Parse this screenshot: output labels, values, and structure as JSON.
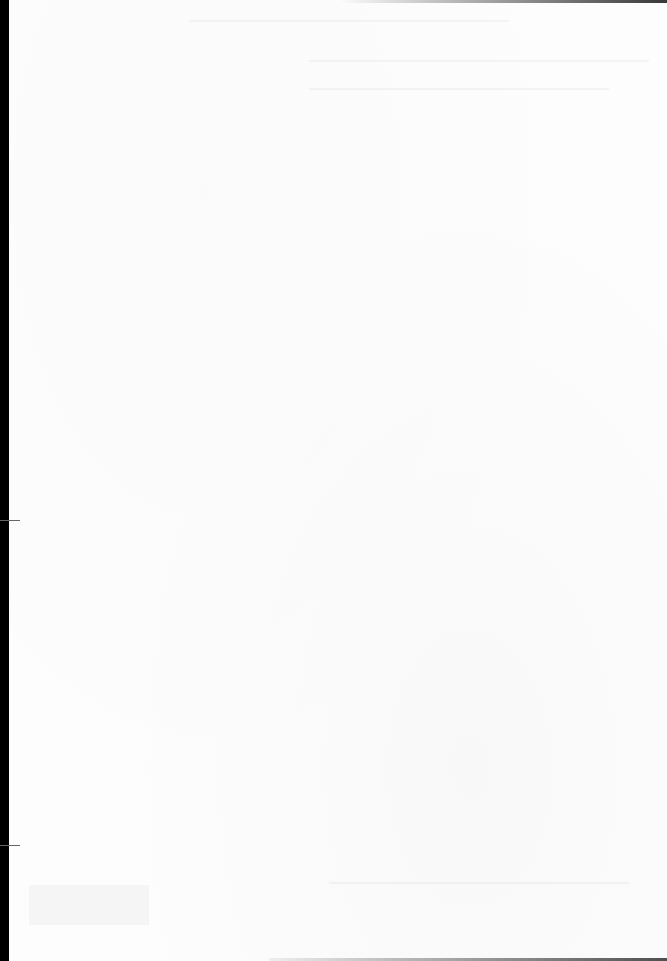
{
  "document": {
    "type": "scanned-page",
    "background_color": "#fdfdfd",
    "border_color": "#000000",
    "content": "",
    "note_visible_text": ""
  }
}
